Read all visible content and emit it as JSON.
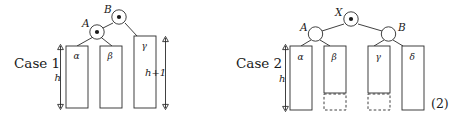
{
  "figure": {
    "equation_number": "(2)",
    "cases": [
      {
        "id": "case-1",
        "label": "Case 1",
        "nodes": [
          {
            "name": "A",
            "label": "A",
            "filled": true
          },
          {
            "name": "B",
            "label": "B",
            "filled": true
          }
        ],
        "subtrees": [
          {
            "name": "alpha",
            "label": "α",
            "height_class": "h"
          },
          {
            "name": "beta",
            "label": "β",
            "height_class": "h"
          },
          {
            "name": "gamma",
            "label": "γ",
            "height_class": "h+1"
          }
        ],
        "dimensions": [
          {
            "name": "left-height",
            "label": "h"
          },
          {
            "name": "right-height",
            "label": "h+1"
          }
        ]
      },
      {
        "id": "case-2",
        "label": "Case 2",
        "nodes": [
          {
            "name": "X",
            "label": "X",
            "filled": true
          },
          {
            "name": "A",
            "label": "A",
            "filled": false
          },
          {
            "name": "B",
            "label": "B",
            "filled": false
          }
        ],
        "subtrees": [
          {
            "name": "alpha",
            "label": "α",
            "has_dashed_extension": false
          },
          {
            "name": "beta",
            "label": "β",
            "has_dashed_extension": true
          },
          {
            "name": "gamma",
            "label": "γ",
            "has_dashed_extension": true
          },
          {
            "name": "delta",
            "label": "δ",
            "has_dashed_extension": false
          }
        ],
        "dimensions": [
          {
            "name": "left-height",
            "label": "h"
          }
        ]
      }
    ],
    "colors": {
      "stroke": "#2b2b2b",
      "text": "#1a1a1a",
      "background": "#ffffff"
    }
  }
}
